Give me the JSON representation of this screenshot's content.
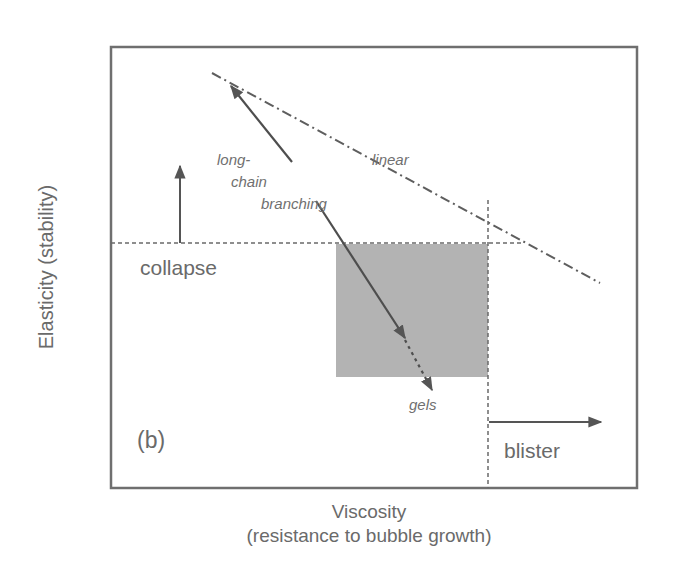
{
  "figure": {
    "panel_label": "(b)",
    "y_axis_label": "Elasticity (stability)",
    "x_axis_label_line1": "Viscosity",
    "x_axis_label_line2": "(resistance to bubble growth)",
    "regions": {
      "collapse": "collapse",
      "blister": "blister"
    },
    "curves": {
      "linear": "linear",
      "long_chain_line1": "long-",
      "long_chain_line2": "chain",
      "long_chain_line3": "branching",
      "gels": "gels"
    },
    "colors": {
      "frame": "#6f6f6f",
      "lines": "#5a5a5a",
      "shaded_region": "#b3b3b3",
      "text": "#6a6a6a"
    }
  }
}
